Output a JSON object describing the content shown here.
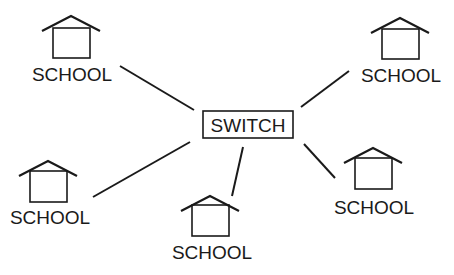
{
  "diagram": {
    "hub": {
      "label": "SWITCH",
      "x": 203,
      "y": 111,
      "w": 90,
      "h": 27
    },
    "nodes": [
      {
        "id": "school-top-left",
        "label": "SCHOOL",
        "cx": 71,
        "roofY": 16,
        "boxTop": 28,
        "boxBottom": 58,
        "labelY": 81
      },
      {
        "id": "school-top-right",
        "label": "SCHOOL",
        "cx": 400,
        "roofY": 18,
        "boxTop": 29,
        "boxBottom": 59,
        "labelY": 82
      },
      {
        "id": "school-bottom-left",
        "label": "SCHOOL",
        "cx": 48,
        "roofY": 161,
        "boxTop": 171,
        "boxBottom": 202,
        "labelY": 224
      },
      {
        "id": "school-bottom-center",
        "label": "SCHOOL",
        "cx": 210,
        "roofY": 196,
        "boxTop": 205,
        "boxBottom": 236,
        "labelY": 259
      },
      {
        "id": "school-bottom-right",
        "label": "SCHOOL",
        "cx": 373,
        "roofY": 148,
        "boxTop": 158,
        "boxBottom": 189,
        "labelY": 214
      }
    ],
    "links": [
      {
        "from": "school-top-left",
        "x1": 120,
        "y1": 66,
        "x2": 194,
        "y2": 110
      },
      {
        "from": "school-top-right",
        "x1": 349,
        "y1": 71,
        "x2": 301,
        "y2": 107
      },
      {
        "from": "school-bottom-left",
        "x1": 93,
        "y1": 197,
        "x2": 190,
        "y2": 142
      },
      {
        "from": "school-bottom-center",
        "x1": 232,
        "y1": 196,
        "x2": 243,
        "y2": 147
      },
      {
        "from": "school-bottom-right",
        "x1": 335,
        "y1": 178,
        "x2": 304,
        "y2": 144
      }
    ],
    "colors": {
      "stroke": "#1a1a1a",
      "background": "#ffffff"
    }
  }
}
